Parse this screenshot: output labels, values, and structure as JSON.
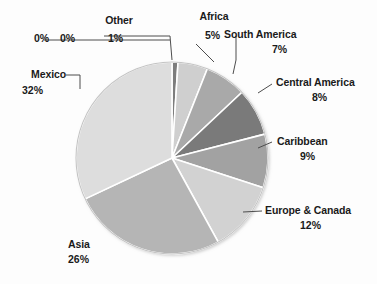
{
  "chart_data": {
    "type": "pie",
    "title": "",
    "subtitle": "",
    "xlabel": "",
    "ylabel": "",
    "legend_position": "labels-around-pie",
    "grid": false,
    "start_angle_deg": 0,
    "direction": "clockwise",
    "categories": [
      "Other",
      "Africa",
      "South America",
      "Central America",
      "Caribbean",
      "Europe & Canada",
      "Asia",
      "Mexico",
      "",
      ""
    ],
    "values": [
      1,
      5,
      7,
      8,
      9,
      12,
      26,
      32,
      0,
      0
    ],
    "slices": [
      {
        "label": "Other",
        "percent_text": "1%",
        "value": 1,
        "color": "#7d7d7d"
      },
      {
        "label": "Africa",
        "percent_text": "5%",
        "value": 5,
        "color": "#cfcfcf"
      },
      {
        "label": "South America",
        "percent_text": "7%",
        "value": 7,
        "color": "#a9a9a9"
      },
      {
        "label": "Central America",
        "percent_text": "8%",
        "value": 8,
        "color": "#7a7a7a"
      },
      {
        "label": "Caribbean",
        "percent_text": "9%",
        "value": 9,
        "color": "#a2a2a2"
      },
      {
        "label": "Europe & Canada",
        "percent_text": "12%",
        "value": 12,
        "color": "#d2d2d2"
      },
      {
        "label": "Asia",
        "percent_text": "26%",
        "value": 26,
        "color": "#b5b5b5"
      },
      {
        "label": "Mexico",
        "percent_text": "32%",
        "value": 32,
        "color": "#dddddd"
      },
      {
        "label": "",
        "percent_text": "0%",
        "value": 0,
        "color": "#c8c8c8"
      },
      {
        "label": "",
        "percent_text": "0%",
        "value": 0,
        "color": "#c8c8c8"
      }
    ],
    "zero_labels": [
      "0%",
      "0%"
    ],
    "units": "percent",
    "total": 100
  },
  "labels": {
    "other": {
      "name": "Other",
      "percent": "1%"
    },
    "zero_a": "0%",
    "zero_b": "0%",
    "africa": {
      "name": "Africa",
      "percent": "5%"
    },
    "south_america": {
      "name": "South America",
      "percent": "7%"
    },
    "central_america": {
      "name": "Central America",
      "percent": "8%"
    },
    "caribbean": {
      "name": "Caribbean",
      "percent": "9%"
    },
    "europe_canada": {
      "name": "Europe & Canada",
      "percent": "12%"
    },
    "asia": {
      "name": "Asia",
      "percent": "26%"
    },
    "mexico": {
      "name": "Mexico",
      "percent": "32%"
    }
  },
  "colors": {
    "background": "#fdfdfd",
    "text": "#1a1a1a",
    "leader": "#555555",
    "slice_border": "#ffffff",
    "pie_outline": "#bdbdbd"
  }
}
